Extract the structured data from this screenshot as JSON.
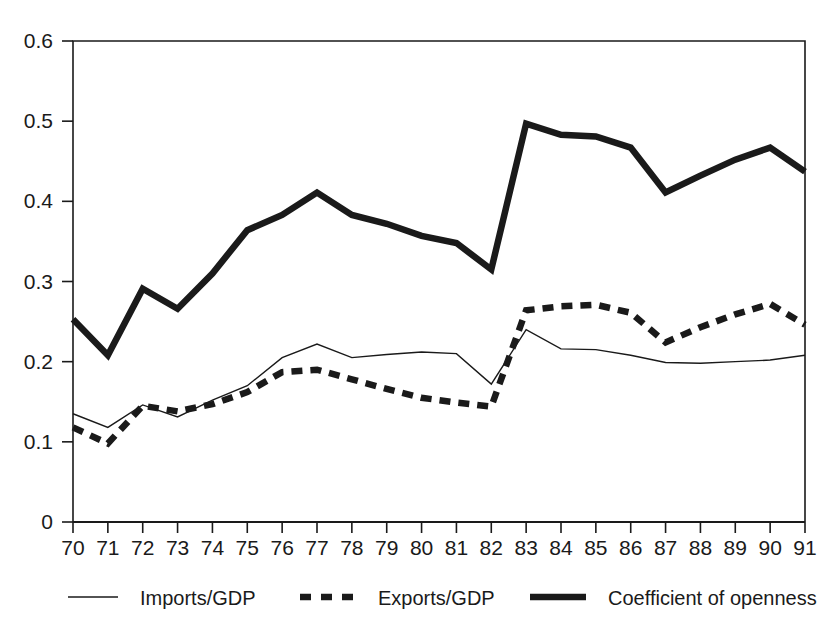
{
  "figure": {
    "background_color": "#ffffff",
    "ink_color": "#1a1a1a"
  },
  "chart_data": {
    "type": "line",
    "title": "",
    "subtitle": "",
    "xlabel": "",
    "ylabel": "",
    "categories": [
      "70",
      "71",
      "72",
      "73",
      "74",
      "75",
      "76",
      "77",
      "78",
      "79",
      "80",
      "81",
      "82",
      "83",
      "84",
      "85",
      "86",
      "87",
      "88",
      "89",
      "90",
      "91"
    ],
    "x_tick_labels": [
      "70",
      "71",
      "72",
      "73",
      "74",
      "75",
      "76",
      "77",
      "78",
      "79",
      "80",
      "81",
      "82",
      "83",
      "84",
      "85",
      "86",
      "87",
      "88",
      "89",
      "90",
      "91"
    ],
    "y_tick_labels": [
      "0",
      "0.1",
      "0.2",
      "0.3",
      "0.4",
      "0.5",
      "0.6"
    ],
    "y_tick_values": [
      0,
      0.1,
      0.2,
      0.3,
      0.4,
      0.5,
      0.6
    ],
    "ylim": [
      0,
      0.6
    ],
    "xlim": [
      "70",
      "91"
    ],
    "grid": false,
    "legend_position": "bottom",
    "series": [
      {
        "name": "Imports/GDP",
        "style": "solid",
        "line_width": 1.4,
        "color": "#1a1a1a",
        "values": [
          0.135,
          0.118,
          0.146,
          0.131,
          0.152,
          0.17,
          0.205,
          0.222,
          0.205,
          0.209,
          0.212,
          0.21,
          0.172,
          0.24,
          0.216,
          0.215,
          0.208,
          0.199,
          0.198,
          0.2,
          0.202,
          0.208
        ]
      },
      {
        "name": "Exports/GDP",
        "style": "dashed",
        "line_width": 6.5,
        "dash_pattern": "11,8",
        "color": "#1a1a1a",
        "values": [
          0.118,
          0.098,
          0.145,
          0.138,
          0.147,
          0.162,
          0.187,
          0.19,
          0.178,
          0.166,
          0.155,
          0.149,
          0.144,
          0.264,
          0.269,
          0.271,
          0.261,
          0.224,
          0.243,
          0.259,
          0.272,
          0.246
        ]
      },
      {
        "name": "Coefficient of openness",
        "style": "solid",
        "line_width": 6.5,
        "color": "#1a1a1a",
        "values": [
          0.253,
          0.208,
          0.291,
          0.266,
          0.31,
          0.364,
          0.383,
          0.411,
          0.383,
          0.372,
          0.357,
          0.348,
          0.315,
          0.497,
          0.483,
          0.481,
          0.467,
          0.411,
          0.432,
          0.452,
          0.467,
          0.437
        ]
      }
    ]
  },
  "legend": {
    "items": [
      {
        "label": "Imports/GDP",
        "marker": "thin-solid-line"
      },
      {
        "label": "Exports/GDP",
        "marker": "thick-dashed-line"
      },
      {
        "label": "Coefficient of openness",
        "marker": "thick-solid-line"
      }
    ]
  },
  "plot_geometry": {
    "left": 73,
    "right": 805,
    "top": 41,
    "bottom": 522
  }
}
